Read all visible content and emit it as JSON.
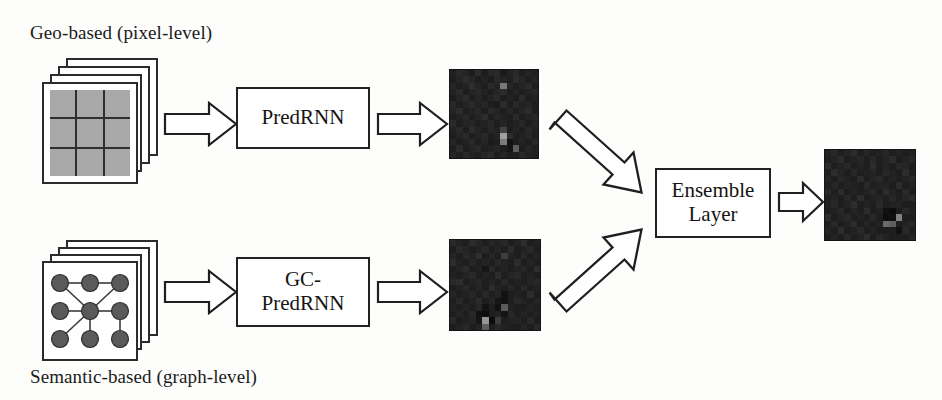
{
  "figure": {
    "type": "architecture-flow-diagram",
    "title": "",
    "background_color": "#fdfdfc",
    "ink_color": "#1b1b1b"
  },
  "captions": {
    "geo": "Geo-based (pixel-level)",
    "semantic": "Semantic-based (graph-level)"
  },
  "inputs": [
    {
      "id": "geo-input",
      "kind": "pixel-grid-stack",
      "caption": "Geo-based (pixel-level)",
      "sheets": 4,
      "grid_rows": 3,
      "grid_cols": 3,
      "cell_color": "#a9a9a9"
    },
    {
      "id": "semantic-input",
      "kind": "graph-stack",
      "caption": "Semantic-based (graph-level)",
      "sheets": 4,
      "nodes": 9,
      "node_color": "#5a5a5a",
      "edges": 10
    }
  ],
  "modules": [
    {
      "id": "predrnn",
      "lines": [
        "PredRNN"
      ],
      "label": "PredRNN"
    },
    {
      "id": "gcpredrnn",
      "lines": [
        "GC-",
        "PredRNN"
      ],
      "label": "GC-PredRNN"
    },
    {
      "id": "ensemble",
      "lines": [
        "Ensemble",
        "Layer"
      ],
      "label": "Ensemble Layer"
    }
  ],
  "arrows": [
    {
      "id": "arrow-geo-to-predrnn",
      "from": "geo-input",
      "to": "predrnn",
      "direction": "right"
    },
    {
      "id": "arrow-predrnn-to-map1",
      "from": "predrnn",
      "to": "heatmap-top",
      "direction": "right"
    },
    {
      "id": "arrow-map1-to-ensemble",
      "from": "heatmap-top",
      "to": "ensemble",
      "direction": "down-right"
    },
    {
      "id": "arrow-sem-to-gcpredrnn",
      "from": "semantic-input",
      "to": "gcpredrnn",
      "direction": "right"
    },
    {
      "id": "arrow-gcpredrnn-to-map2",
      "from": "gcpredrnn",
      "to": "heatmap-bottom",
      "direction": "right"
    },
    {
      "id": "arrow-map2-to-ensemble",
      "from": "heatmap-bottom",
      "to": "ensemble",
      "direction": "up-right"
    },
    {
      "id": "arrow-ensemble-to-output",
      "from": "ensemble",
      "to": "heatmap-output",
      "direction": "right"
    }
  ],
  "heatmaps": [
    {
      "id": "heatmap-top",
      "rows": 14,
      "cols": 14,
      "values": [
        [
          32,
          40,
          36,
          28,
          44,
          30,
          38,
          42,
          26,
          34,
          40,
          30,
          36,
          32
        ],
        [
          30,
          36,
          44,
          38,
          30,
          34,
          28,
          40,
          36,
          32,
          44,
          38,
          30,
          36
        ],
        [
          38,
          30,
          34,
          46,
          36,
          30,
          42,
          34,
          120,
          38,
          30,
          36,
          42,
          30
        ],
        [
          34,
          42,
          30,
          36,
          40,
          34,
          30,
          38,
          44,
          30,
          36,
          30,
          34,
          40
        ],
        [
          28,
          36,
          44,
          30,
          38,
          30,
          36,
          42,
          30,
          36,
          28,
          44,
          30,
          34
        ],
        [
          40,
          30,
          36,
          42,
          34,
          38,
          30,
          28,
          44,
          30,
          40,
          34,
          36,
          30
        ],
        [
          36,
          44,
          30,
          34,
          40,
          30,
          42,
          36,
          30,
          38,
          30,
          36,
          44,
          30
        ],
        [
          30,
          34,
          40,
          30,
          36,
          44,
          30,
          38,
          34,
          30,
          42,
          30,
          34,
          38
        ],
        [
          42,
          30,
          36,
          38,
          30,
          34,
          40,
          30,
          36,
          30,
          34,
          40,
          30,
          36
        ],
        [
          34,
          40,
          30,
          44,
          36,
          30,
          38,
          34,
          66,
          30,
          36,
          30,
          40,
          34
        ],
        [
          30,
          36,
          42,
          30,
          34,
          40,
          30,
          36,
          160,
          44,
          30,
          34,
          38,
          30
        ],
        [
          38,
          30,
          34,
          40,
          30,
          36,
          28,
          30,
          124,
          18,
          30,
          36,
          30,
          40
        ],
        [
          30,
          44,
          30,
          36,
          40,
          30,
          34,
          38,
          30,
          22,
          95,
          30,
          36,
          30
        ],
        [
          36,
          30,
          40,
          34,
          30,
          38,
          42,
          30,
          36,
          30,
          30,
          40,
          34,
          30
        ]
      ]
    },
    {
      "id": "heatmap-bottom",
      "rows": 14,
      "cols": 14,
      "values": [
        [
          40,
          34,
          30,
          44,
          36,
          30,
          38,
          34,
          40,
          30,
          36,
          44,
          30,
          34
        ],
        [
          30,
          42,
          36,
          30,
          34,
          40,
          30,
          36,
          30,
          44,
          30,
          34,
          40,
          30
        ],
        [
          36,
          30,
          40,
          34,
          46,
          30,
          38,
          30,
          62,
          34,
          30,
          40,
          30,
          36
        ],
        [
          44,
          34,
          30,
          38,
          30,
          36,
          30,
          40,
          34,
          30,
          44,
          30,
          36,
          30
        ],
        [
          30,
          36,
          44,
          30,
          34,
          22,
          40,
          30,
          36,
          30,
          34,
          38,
          30,
          44
        ],
        [
          34,
          30,
          36,
          40,
          30,
          34,
          30,
          44,
          30,
          36,
          40,
          30,
          34,
          30
        ],
        [
          40,
          44,
          30,
          34,
          38,
          30,
          36,
          30,
          40,
          30,
          34,
          30,
          36,
          40
        ],
        [
          30,
          34,
          40,
          30,
          36,
          30,
          44,
          34,
          30,
          38,
          30,
          40,
          30,
          34
        ],
        [
          36,
          30,
          34,
          38,
          30,
          40,
          30,
          36,
          18,
          30,
          34,
          30,
          44,
          30
        ],
        [
          30,
          40,
          30,
          34,
          44,
          30,
          36,
          22,
          16,
          30,
          40,
          34,
          30,
          36
        ],
        [
          34,
          30,
          36,
          30,
          38,
          18,
          30,
          16,
          90,
          34,
          30,
          30,
          36,
          30
        ],
        [
          30,
          36,
          30,
          40,
          18,
          14,
          30,
          34,
          20,
          40,
          30,
          36,
          30,
          34
        ],
        [
          40,
          30,
          34,
          36,
          22,
          150,
          12,
          60,
          30,
          34,
          36,
          30,
          40,
          30
        ],
        [
          30,
          34,
          40,
          30,
          36,
          95,
          30,
          40,
          34,
          30,
          30,
          36,
          30,
          40
        ]
      ]
    },
    {
      "id": "heatmap-output",
      "rows": 14,
      "cols": 14,
      "values": [
        [
          34,
          40,
          30,
          36,
          44,
          30,
          38,
          30,
          34,
          40,
          30,
          36,
          30,
          34
        ],
        [
          30,
          36,
          44,
          30,
          34,
          38,
          30,
          40,
          30,
          36,
          44,
          30,
          34,
          40
        ],
        [
          42,
          30,
          34,
          40,
          30,
          36,
          30,
          44,
          30,
          34,
          30,
          40,
          36,
          30
        ],
        [
          30,
          44,
          36,
          30,
          40,
          30,
          34,
          36,
          30,
          40,
          34,
          30,
          44,
          30
        ],
        [
          36,
          30,
          40,
          34,
          30,
          44,
          30,
          36,
          40,
          30,
          36,
          30,
          34,
          40
        ],
        [
          30,
          38,
          30,
          36,
          34,
          30,
          40,
          30,
          34,
          36,
          30,
          44,
          30,
          34
        ],
        [
          40,
          30,
          44,
          30,
          36,
          30,
          34,
          40,
          30,
          44,
          34,
          30,
          40,
          30
        ],
        [
          30,
          36,
          30,
          40,
          30,
          44,
          30,
          34,
          36,
          30,
          40,
          30,
          36,
          44
        ],
        [
          34,
          40,
          30,
          34,
          44,
          30,
          36,
          30,
          40,
          30,
          34,
          36,
          30,
          30
        ],
        [
          30,
          34,
          40,
          30,
          36,
          30,
          44,
          30,
          34,
          18,
          12,
          30,
          40,
          34
        ],
        [
          44,
          30,
          36,
          40,
          30,
          34,
          30,
          40,
          30,
          14,
          16,
          130,
          30,
          30
        ],
        [
          30,
          40,
          30,
          34,
          44,
          30,
          36,
          30,
          34,
          108,
          95,
          30,
          34,
          40
        ],
        [
          36,
          30,
          44,
          30,
          34,
          40,
          30,
          36,
          30,
          30,
          30,
          18,
          40,
          30
        ],
        [
          30,
          36,
          30,
          40,
          30,
          34,
          44,
          30,
          40,
          34,
          30,
          30,
          30,
          36
        ]
      ]
    }
  ]
}
